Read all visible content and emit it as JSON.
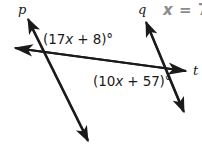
{
  "figure": {
    "type": "geometry-diagram",
    "background_color": "#ffffff",
    "stroke_color": "#1a1a1a"
  },
  "lines": [
    {
      "name": "p",
      "label": "p",
      "arrowheads": "both"
    },
    {
      "name": "q",
      "label": "q",
      "arrowheads": "both"
    },
    {
      "name": "t",
      "label": "t",
      "arrowheads": "both"
    }
  ],
  "labels": {
    "line_p": "p",
    "line_q": "q",
    "line_t": "t"
  },
  "angles": [
    {
      "id": "angle-1",
      "expression": "(17x + 8)°",
      "prefix": "(17",
      "variable": "x",
      "suffix": " + 8)°"
    },
    {
      "id": "angle-2",
      "expression": "(10x + 57)°",
      "prefix": "(10",
      "variable": "x",
      "suffix": " + 57)°"
    }
  ],
  "solution": {
    "variable": "x",
    "equals": " = ",
    "value": "7",
    "full": "x = 7",
    "color": "#8c8c8c"
  }
}
